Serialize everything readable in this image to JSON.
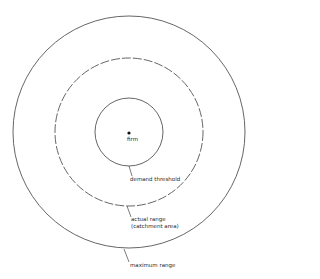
{
  "diagram": {
    "center": {
      "x": 129,
      "y": 132
    },
    "circles": [
      {
        "name": "demand-threshold",
        "radius": 34,
        "style": "solid"
      },
      {
        "name": "actual-range",
        "radius": 74,
        "style": "dashed"
      },
      {
        "name": "maximum-range",
        "radius": 116,
        "style": "solid"
      }
    ],
    "stroke_color": "#555555",
    "labels": {
      "firm": "firm",
      "demand_threshold": "demand threshold",
      "actual_range_line1": "actual range",
      "actual_range_line2": "(catchment area)",
      "maximum_range": "maximum range"
    }
  }
}
